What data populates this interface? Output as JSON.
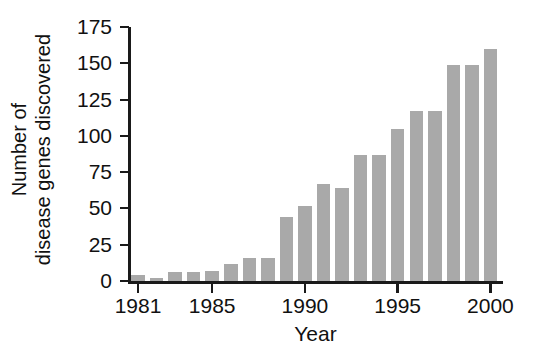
{
  "chart_data": {
    "type": "bar",
    "title": "",
    "subtitle": "",
    "xlabel": "Year",
    "ylabel": "Number of disease genes discovered",
    "ylabel_lines": [
      "Number of",
      "disease genes discovered"
    ],
    "categories": [
      "1981",
      "1982",
      "1983",
      "1984",
      "1985",
      "1986",
      "1987",
      "1988",
      "1989",
      "1990",
      "1991",
      "1992",
      "1993",
      "1994",
      "1995",
      "1996",
      "1997",
      "1998",
      "1999",
      "2000"
    ],
    "values": [
      4,
      2,
      6,
      6,
      7,
      12,
      16,
      16,
      44,
      52,
      67,
      64,
      87,
      87,
      105,
      117,
      117,
      149,
      149,
      160
    ],
    "xlim": [
      1980.5,
      2000.5
    ],
    "ylim": [
      0,
      175
    ],
    "yticks": [
      0,
      25,
      50,
      75,
      100,
      125,
      150,
      175
    ],
    "ytick_labels": [
      "0",
      "25",
      "50",
      "75",
      "100",
      "125",
      "150",
      "175"
    ],
    "xticks": [
      1981,
      1985,
      1990,
      1995,
      2000
    ],
    "xtick_labels": [
      "1981",
      "1985",
      "1990",
      "1995",
      "2000"
    ],
    "grid": false,
    "legend": null,
    "bar_color": "#a9a9a9",
    "axis_color": "#1a1a1a",
    "background": "#ffffff"
  }
}
